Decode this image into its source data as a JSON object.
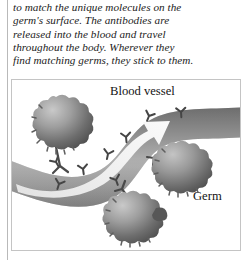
{
  "body_text": {
    "lines": [
      "to match the unique molecules on the",
      "germ's surface. The antibodies are",
      "released into the blood and travel",
      "throughout the body. Wherever they",
      "find matching germs, they stick to them."
    ]
  },
  "illustration": {
    "labels": {
      "blood_vessel": "Blood vessel",
      "germ": "Germ"
    },
    "icons": {
      "blood_vessel_tube": "blood-vessel-icon",
      "flow_arrow": "flow-direction-arrow-icon",
      "antibody": "antibody-y-shape-icon",
      "germ_sphere": "germ-sphere-icon"
    },
    "colors": {
      "vessel_dark": "#7c7c7c",
      "vessel_light": "#d6d6d6",
      "arrow_fill": "#ececec",
      "germ_dark": "#5a5a5a",
      "germ_light": "#b6b6b6",
      "antibody": "#4a4a4a",
      "frame_border": "#c4c4c4",
      "text": "#1b1b1b"
    },
    "counts": {
      "germs": 3,
      "antibodies_in_vessel": 8
    }
  }
}
